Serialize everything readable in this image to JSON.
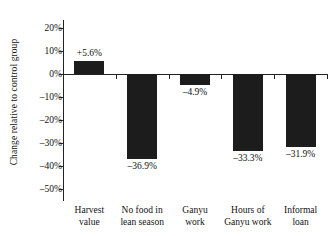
{
  "chart_data": {
    "type": "bar",
    "title": "",
    "xlabel": "",
    "ylabel": "Change relative to control group",
    "ylim": [
      -50,
      20
    ],
    "ytick_step": 10,
    "grid": false,
    "legend": "none",
    "bar_color": "#1c1c1c",
    "axis_color": "#222222",
    "categories": [
      "Harvest value",
      "No food in lean season",
      "Ganyu work",
      "Hours of Ganyu work",
      "Informal loan"
    ],
    "category_lines": [
      [
        "Harvest",
        "value"
      ],
      [
        "No food in",
        "lean season"
      ],
      [
        "Ganyu",
        "work"
      ],
      [
        "Hours of",
        "Ganyu work"
      ],
      [
        "Informal",
        "loan"
      ]
    ],
    "values": [
      5.6,
      -36.9,
      -4.9,
      -33.3,
      -31.9
    ],
    "value_labels": [
      "+5.6%",
      "–36.9%",
      "–4.9%",
      "–33.3%",
      "–31.9%"
    ],
    "ytick_labels": [
      "20%",
      "10%",
      "0%",
      "–10%",
      "–20%",
      "–30%",
      "–40%",
      "–50%"
    ],
    "ytick_values": [
      20,
      10,
      0,
      -10,
      -20,
      -30,
      -40,
      -50
    ]
  }
}
